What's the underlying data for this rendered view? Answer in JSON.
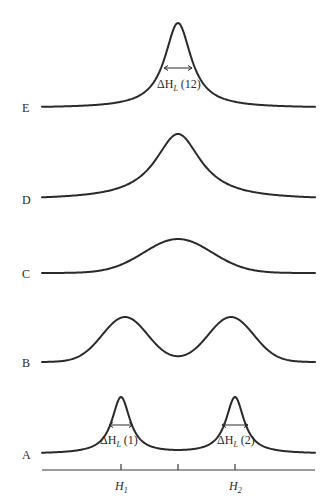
{
  "diagram": {
    "type": "resonance-lineshape-stack",
    "curves": [
      {
        "id": "E",
        "label": "E",
        "baseline_y": 108,
        "kind": "single",
        "center": 178,
        "peak_y": 23,
        "width": 16,
        "shape": "lorentz",
        "label_pos": [
          22,
          102
        ]
      },
      {
        "id": "D",
        "label": "D",
        "baseline_y": 200,
        "kind": "single",
        "center": 178,
        "peak_y": 134,
        "width": 28,
        "shape": "lorentz",
        "label_pos": [
          22,
          194
        ]
      },
      {
        "id": "C",
        "label": "C",
        "baseline_y": 273,
        "kind": "single",
        "center": 178,
        "peak_y": 239,
        "width": 48,
        "shape": "gauss",
        "label_pos": [
          22,
          268
        ]
      },
      {
        "id": "B",
        "label": "B",
        "baseline_y": 362,
        "kind": "double",
        "centers": [
          125,
          231
        ],
        "peak_y": 317,
        "dip_y": 351,
        "width": 32,
        "shape": "gauss",
        "label_pos": [
          22,
          357
        ]
      },
      {
        "id": "A",
        "label": "A",
        "baseline_y": 454,
        "kind": "double",
        "centers": [
          121,
          235
        ],
        "peak_y": 397,
        "width": 11,
        "shape": "lorentz",
        "label_pos": [
          22,
          449
        ]
      }
    ],
    "x_range": [
      42,
      315
    ],
    "axis": {
      "y": 470,
      "x_start": 42,
      "x_end": 315,
      "ticks": [
        121,
        178,
        235
      ]
    },
    "annotations": {
      "dH12": {
        "text_delta": "ΔH",
        "sub": "L",
        "tail": " (12)",
        "arrow": [
          164,
          192,
          68
        ],
        "pos": [
          157,
          78
        ]
      },
      "dH1": {
        "text_delta": "ΔH",
        "sub": "L",
        "tail": " (1)",
        "arrow": [
          109,
          133,
          425
        ],
        "pos": [
          100,
          434
        ]
      },
      "dH2": {
        "text_delta": "ΔH",
        "sub": "L",
        "tail": " (2)",
        "arrow": [
          222,
          248,
          425
        ],
        "pos": [
          217,
          434
        ]
      }
    },
    "axis_labels": [
      {
        "text": "H",
        "sub": "1",
        "pos": [
          115,
          480
        ]
      },
      {
        "text": "H",
        "sub": "2",
        "pos": [
          229,
          480
        ]
      }
    ]
  }
}
